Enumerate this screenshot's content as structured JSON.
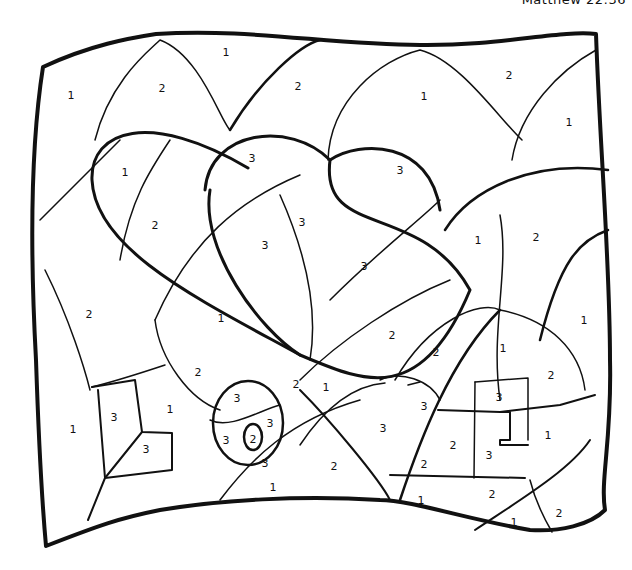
{
  "caption": "Matthew 22:36",
  "legend_note": "Color-by-number page: regions labeled 1, 2, 3",
  "numbers": [
    {
      "v": "1",
      "x": 71,
      "y": 95
    },
    {
      "v": "2",
      "x": 162,
      "y": 88
    },
    {
      "v": "1",
      "x": 226,
      "y": 52
    },
    {
      "v": "2",
      "x": 298,
      "y": 86
    },
    {
      "v": "1",
      "x": 424,
      "y": 96
    },
    {
      "v": "2",
      "x": 509,
      "y": 75
    },
    {
      "v": "1",
      "x": 569,
      "y": 122
    },
    {
      "v": "1",
      "x": 125,
      "y": 172
    },
    {
      "v": "3",
      "x": 252,
      "y": 158
    },
    {
      "v": "3",
      "x": 400,
      "y": 170
    },
    {
      "v": "2",
      "x": 155,
      "y": 225
    },
    {
      "v": "3",
      "x": 265,
      "y": 245
    },
    {
      "v": "3",
      "x": 302,
      "y": 222
    },
    {
      "v": "3",
      "x": 364,
      "y": 266
    },
    {
      "v": "1",
      "x": 478,
      "y": 240
    },
    {
      "v": "2",
      "x": 536,
      "y": 237
    },
    {
      "v": "2",
      "x": 89,
      "y": 314
    },
    {
      "v": "1",
      "x": 221,
      "y": 318
    },
    {
      "v": "2",
      "x": 392,
      "y": 335
    },
    {
      "v": "1",
      "x": 584,
      "y": 320
    },
    {
      "v": "2",
      "x": 436,
      "y": 352
    },
    {
      "v": "1",
      "x": 503,
      "y": 348
    },
    {
      "v": "2",
      "x": 198,
      "y": 372
    },
    {
      "v": "2",
      "x": 551,
      "y": 375
    },
    {
      "v": "2",
      "x": 296,
      "y": 384
    },
    {
      "v": "1",
      "x": 326,
      "y": 387
    },
    {
      "v": "3",
      "x": 237,
      "y": 398
    },
    {
      "v": "3",
      "x": 424,
      "y": 406
    },
    {
      "v": "3",
      "x": 499,
      "y": 397
    },
    {
      "v": "1",
      "x": 73,
      "y": 429
    },
    {
      "v": "3",
      "x": 114,
      "y": 417
    },
    {
      "v": "1",
      "x": 170,
      "y": 409
    },
    {
      "v": "3",
      "x": 270,
      "y": 423
    },
    {
      "v": "3",
      "x": 383,
      "y": 428
    },
    {
      "v": "3",
      "x": 146,
      "y": 449
    },
    {
      "v": "3",
      "x": 226,
      "y": 440
    },
    {
      "v": "2",
      "x": 253,
      "y": 439
    },
    {
      "v": "2",
      "x": 453,
      "y": 445
    },
    {
      "v": "3",
      "x": 489,
      "y": 455
    },
    {
      "v": "1",
      "x": 548,
      "y": 435
    },
    {
      "v": "3",
      "x": 265,
      "y": 463
    },
    {
      "v": "2",
      "x": 334,
      "y": 466
    },
    {
      "v": "2",
      "x": 424,
      "y": 464
    },
    {
      "v": "1",
      "x": 273,
      "y": 487
    },
    {
      "v": "1",
      "x": 421,
      "y": 500
    },
    {
      "v": "2",
      "x": 492,
      "y": 494
    },
    {
      "v": "1",
      "x": 514,
      "y": 522
    },
    {
      "v": "2",
      "x": 559,
      "y": 513
    }
  ]
}
